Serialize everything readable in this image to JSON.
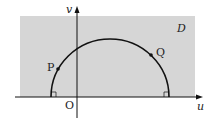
{
  "diagram": {
    "region_label": "D",
    "axis_x_label": "u",
    "axis_y_label": "v",
    "origin_label": "O",
    "point_p_label": "P",
    "point_q_label": "Q",
    "colors": {
      "region": "#d6d6d6",
      "stroke": "#111111"
    }
  }
}
